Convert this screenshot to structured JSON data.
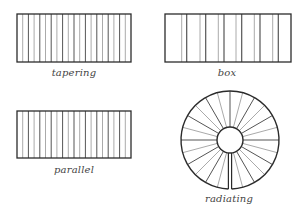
{
  "diagrams": [
    {
      "id": "tapering",
      "label": "tapering",
      "type": "rectangle-lines",
      "rect": {
        "x": 17,
        "y": 14,
        "w": 114,
        "h": 48
      },
      "line_count": 19,
      "label_pos": {
        "x": 74,
        "y": 67
      }
    },
    {
      "id": "box",
      "label": "box",
      "type": "rectangle-pairs",
      "rect": {
        "x": 165,
        "y": 14,
        "w": 126,
        "h": 48
      },
      "pairs": [
        {
          "grey": 181.7,
          "dark": 186.7
        },
        {
          "grey": 200.0,
          "dark": 205.7
        },
        {
          "grey": 218.3,
          "dark": 224.0
        },
        {
          "grey": 236.0,
          "dark": 241.7
        },
        {
          "grey": 254.3,
          "dark": 260.0
        },
        {
          "grey": 272.7,
          "dark": 278.3
        }
      ],
      "label_pos": {
        "x": 227,
        "y": 67
      }
    },
    {
      "id": "parallel",
      "label": "parallel",
      "type": "rectangle-lines",
      "rect": {
        "x": 17,
        "y": 111,
        "w": 114,
        "h": 47
      },
      "line_count": 19,
      "label_pos": {
        "x": 74,
        "y": 164
      }
    },
    {
      "id": "radiating",
      "label": "radiating",
      "type": "radial",
      "center": {
        "x": 230,
        "y": 140
      },
      "outer_radius": 49,
      "inner_radius": 13,
      "spoke_count": 24,
      "label_pos": {
        "x": 229,
        "y": 193
      }
    }
  ],
  "colors": {
    "outline": "#2b2b2b",
    "dark_line": "#555555",
    "light_line": "#aaaaaa",
    "label": "#444444"
  }
}
